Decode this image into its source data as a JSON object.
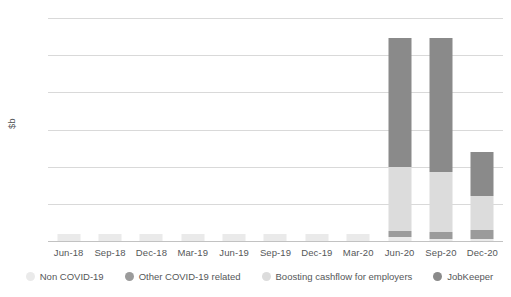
{
  "chart_data": {
    "type": "bar",
    "stacked": true,
    "title": "",
    "xlabel": "",
    "ylabel": "$b",
    "ylim": [
      0,
      60
    ],
    "yticks": [
      0,
      10,
      20,
      30,
      40,
      50,
      60
    ],
    "grid": true,
    "legend_position": "bottom",
    "categories": [
      "Jun-18",
      "Sep-18",
      "Dec-18",
      "Mar-19",
      "Jun-19",
      "Sep-19",
      "Dec-19",
      "Mar-20",
      "Jun-20",
      "Sep-20",
      "Dec-20"
    ],
    "series": [
      {
        "name": "Non COVID-19",
        "color": "#eaeaea",
        "values": [
          2.0,
          2.0,
          2.0,
          2.0,
          2.0,
          2.0,
          2.0,
          2.0,
          1.0,
          0.5,
          0.5
        ]
      },
      {
        "name": "Other COVID-19 related",
        "color": "#9b9b9b",
        "values": [
          0,
          0,
          0,
          0,
          0,
          0,
          0,
          0,
          1.8,
          1.8,
          2.5
        ]
      },
      {
        "name": "Boosting cashflow for employers",
        "color": "#dcdcdc",
        "values": [
          0,
          0,
          0,
          0,
          0,
          0,
          0,
          0,
          17.2,
          16.2,
          9.0
        ]
      },
      {
        "name": "JobKeeper",
        "color": "#8a8a8a",
        "values": [
          0,
          0,
          0,
          0,
          0,
          0,
          0,
          0,
          34.5,
          36.0,
          12.0
        ]
      }
    ],
    "totals": [
      2.0,
      2.0,
      2.0,
      2.0,
      2.0,
      2.0,
      2.0,
      2.0,
      54.5,
      54.5,
      24.0
    ]
  },
  "legend": {
    "items": [
      {
        "label": "Non COVID-19"
      },
      {
        "label": "Other COVID-19 related"
      },
      {
        "label": "Boosting cashflow for employers"
      },
      {
        "label": "JobKeeper"
      }
    ]
  }
}
